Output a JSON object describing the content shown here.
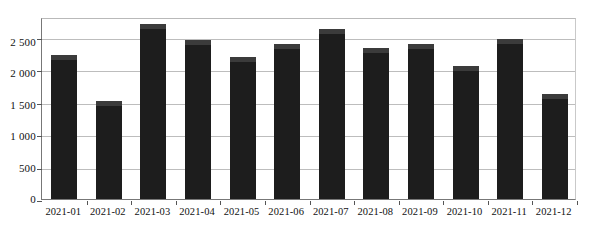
{
  "chart_data": {
    "type": "bar",
    "title": "",
    "subtitle": "",
    "xlabel": "",
    "ylabel": "",
    "categories": [
      "2021-01",
      "2021-02",
      "2021-03",
      "2021-04",
      "2021-05",
      "2021-06",
      "2021-07",
      "2021-08",
      "2021-09",
      "2021-10",
      "2021-11",
      "2021-12"
    ],
    "values": [
      2210,
      1510,
      2690,
      2440,
      2190,
      2390,
      2610,
      2320,
      2380,
      2040,
      2460,
      1620
    ],
    "ylim": [
      0,
      2800
    ],
    "yticks": [
      0,
      500,
      1000,
      1500,
      2000,
      2500
    ],
    "ytick_labels": [
      "0",
      "500",
      "1 000",
      "1 500",
      "2 000",
      "2 500"
    ],
    "grid": true,
    "legend": false,
    "legend_position": "none",
    "bar_color": "#1d1d1d",
    "bar_cap_color": "#3b3b3b",
    "grid_color": "#bdbdbd",
    "axis_color": "#777777",
    "background_color": "#ffffff"
  }
}
